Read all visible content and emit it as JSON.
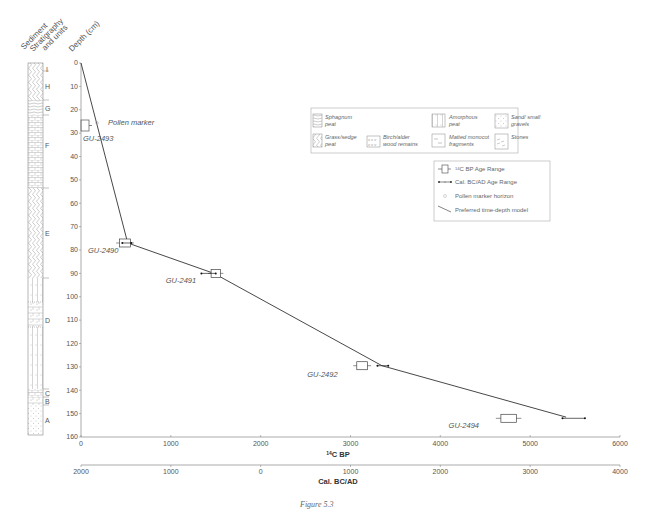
{
  "column_headers": {
    "sediment": "Sediment",
    "stratigraphy": "Stratigraphy",
    "and_units": "and units",
    "depth": "Depth (cm)"
  },
  "units": [
    {
      "label": "I",
      "top": 0,
      "bottom": 5
    },
    {
      "label": "H",
      "top": 5,
      "bottom": 16
    },
    {
      "label": "G",
      "top": 16,
      "bottom": 24
    },
    {
      "label": "F",
      "top": 24,
      "bottom": 55
    },
    {
      "label": "E",
      "top": 55,
      "bottom": 80
    },
    {
      "label": "D",
      "top": 80,
      "bottom": 128
    },
    {
      "label": "C",
      "top": 128,
      "bottom": 131
    },
    {
      "label": "B",
      "top": 131,
      "bottom": 135
    },
    {
      "label": "A",
      "top": 135,
      "bottom": 155
    }
  ],
  "legend_sediment": [
    {
      "label1": "Sphagnum",
      "label2": "peat",
      "pattern": "sphagnum"
    },
    {
      "label1": "Amorphous",
      "label2": "peat",
      "pattern": "amorphous"
    },
    {
      "label1": "Sand/ small",
      "label2": "gravels",
      "pattern": "sand"
    },
    {
      "label1": "Grass/sedge",
      "label2": "peat",
      "pattern": "grass"
    },
    {
      "label1": "Birch/alder",
      "label2": "wood remains",
      "pattern": "birch"
    },
    {
      "label1": "Matted monocot",
      "label2": "fragments",
      "pattern": "monocot"
    },
    {
      "label1": "Stones",
      "label2": "",
      "pattern": "stones"
    }
  ],
  "legend_symbols": [
    {
      "label": "¹⁴C BP Age Range",
      "symbol": "box-range"
    },
    {
      "label": "Cal. BC/AD Age Range",
      "symbol": "dot-range"
    },
    {
      "label": "Pollen marker horizon",
      "symbol": "circle"
    },
    {
      "label": "Preferred time-depth model",
      "symbol": "line"
    }
  ],
  "pollen_marker_label": "Pollen marker",
  "caption": "Figure 5.3",
  "chart_data": {
    "type": "scatter",
    "title": "",
    "xlabel": "14C BP",
    "xlabel_secondary": "Cal. BC/AD",
    "ylabel": "Depth (cm)",
    "xlim": [
      0,
      6000
    ],
    "ylim": [
      160,
      0
    ],
    "x_ticks": [
      0,
      1000,
      2000,
      3000,
      4000,
      5000,
      6000
    ],
    "x2_ticks": [
      "2000",
      "1000",
      "0",
      "1000",
      "2000",
      "3000",
      "4000"
    ],
    "y_ticks": [
      0,
      10,
      20,
      30,
      40,
      50,
      60,
      70,
      80,
      90,
      100,
      110,
      120,
      130,
      140,
      150,
      160
    ],
    "grid": false,
    "samples": [
      {
        "id": "GU-2493",
        "depth_top": 23.5,
        "depth_bottom": 29.5,
        "c14_bp": 0,
        "box_width_bp": 90,
        "note": "Pollen marker"
      },
      {
        "id": "GU-2490",
        "depth": 77,
        "c14_bp_min": 420,
        "c14_bp_max": 560,
        "cal_min": 460,
        "cal_max": 560
      },
      {
        "id": "GU-2491",
        "depth": 90,
        "c14_bp_min": 1440,
        "c14_bp_max": 1560,
        "cal_min": 1340,
        "cal_max": 1500
      },
      {
        "id": "GU-2492",
        "depth": 129.5,
        "c14_bp_min": 3060,
        "c14_bp_max": 3200,
        "cal_min": 3300,
        "cal_max": 3420
      },
      {
        "id": "GU-2494",
        "depth": 152,
        "c14_bp_min": 4660,
        "c14_bp_max": 4860,
        "cal_min": 5360,
        "cal_max": 5610
      }
    ],
    "model_line": {
      "name": "Preferred time-depth model",
      "x": [
        0,
        520,
        1480,
        3350,
        5400
      ],
      "y": [
        0,
        77,
        90,
        129.5,
        151.5
      ]
    }
  }
}
